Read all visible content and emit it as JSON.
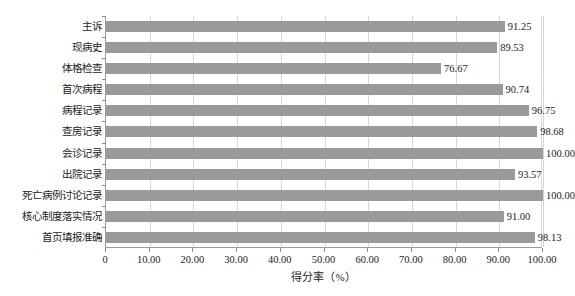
{
  "chart_data": {
    "type": "bar",
    "orientation": "horizontal",
    "title": "",
    "xlabel": "得分率（%）",
    "ylabel": "",
    "xlim": [
      0,
      100
    ],
    "grid": true,
    "legend": false,
    "bar_color": "#9a9a9a",
    "categories": [
      "主诉",
      "现病史",
      "体格检查",
      "首次病程",
      "病程记录",
      "查房记录",
      "会诊记录",
      "出院记录",
      "死亡病例讨论记录",
      "核心制度落实情况",
      "首页填报准确"
    ],
    "values": [
      91.25,
      89.53,
      76.67,
      90.74,
      96.75,
      98.68,
      100.0,
      93.57,
      100.0,
      91.0,
      98.13
    ],
    "value_labels": [
      "91.25",
      "89.53",
      "76.67",
      "90.74",
      "96.75",
      "98.68",
      "100.00",
      "93.57",
      "100.00",
      "91.00",
      "98.13"
    ],
    "xticks": [
      0,
      10,
      20,
      30,
      40,
      50,
      60,
      70,
      80,
      90,
      100
    ],
    "xtick_labels": [
      "0",
      "10.00",
      "20.00",
      "30.00",
      "40.00",
      "50.00",
      "60.00",
      "70.00",
      "80.00",
      "90.00",
      "100.00"
    ]
  },
  "caption": ""
}
